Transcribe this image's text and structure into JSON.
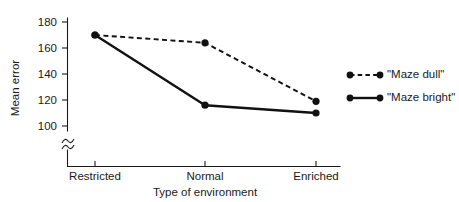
{
  "chart_data": {
    "type": "line",
    "title": "",
    "subtitle": "",
    "xlabel": "Type of environment",
    "ylabel": "Mean error",
    "categories": [
      "Restricted",
      "Normal",
      "Enriched"
    ],
    "series": [
      {
        "name": "\"Maze dull\"",
        "style": "dashed",
        "marker": "filled-circle",
        "values": [
          170,
          164,
          119
        ]
      },
      {
        "name": "\"Maze bright\"",
        "style": "solid",
        "marker": "filled-circle",
        "values": [
          170,
          116,
          110
        ]
      }
    ],
    "yticks": [
      100,
      120,
      140,
      160,
      180
    ],
    "ytick_labels": [
      "100",
      "120",
      "140",
      "160",
      "180"
    ],
    "ylim": [
      100,
      185
    ],
    "grid": false,
    "y_axis_break": true,
    "y_axis_break_symbol": "squiggle",
    "legend_position": "right",
    "colors": {
      "line": "#111111",
      "axis": "#1a1a1a",
      "background": "#ffffff"
    }
  },
  "axes": {
    "y_label": "Mean error",
    "x_label": "Type of environment",
    "y_ticks": [
      {
        "value": 180,
        "label": "180"
      },
      {
        "value": 160,
        "label": "160"
      },
      {
        "value": 140,
        "label": "140"
      },
      {
        "value": 120,
        "label": "120"
      },
      {
        "value": 100,
        "label": "100"
      }
    ],
    "x_ticks": [
      {
        "label": "Restricted"
      },
      {
        "label": "Normal"
      },
      {
        "label": "Enriched"
      }
    ]
  },
  "legend": {
    "items": [
      {
        "label": "\"Maze dull\"",
        "style": "dashed"
      },
      {
        "label": "\"Maze bright\"",
        "style": "solid"
      }
    ]
  }
}
